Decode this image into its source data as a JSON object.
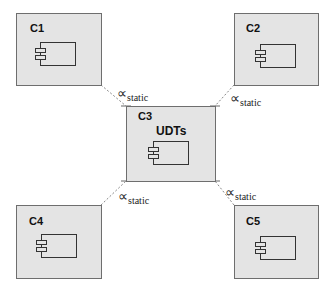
{
  "diagram": {
    "type": "component-diagram",
    "nodes": [
      {
        "id": "C1",
        "label": "C1",
        "sublabel": ""
      },
      {
        "id": "C2",
        "label": "C2",
        "sublabel": ""
      },
      {
        "id": "C3",
        "label": "C3",
        "sublabel": "UDTs"
      },
      {
        "id": "C4",
        "label": "C4",
        "sublabel": ""
      },
      {
        "id": "C5",
        "label": "C5",
        "sublabel": ""
      }
    ],
    "connectors": [
      {
        "from": "C1",
        "to": "C3",
        "symbol": "∝",
        "subscript": "static",
        "style": "dashed"
      },
      {
        "from": "C2",
        "to": "C3",
        "symbol": "∝",
        "subscript": "static",
        "style": "dashed"
      },
      {
        "from": "C4",
        "to": "C3",
        "symbol": "∝",
        "subscript": "static",
        "style": "dashed"
      },
      {
        "from": "C5",
        "to": "C3",
        "symbol": "∝",
        "subscript": "static",
        "style": "dashed"
      }
    ],
    "colors": {
      "node_fill": "#e4e4e4",
      "node_border": "#6e6e6e",
      "connector": "#888888"
    }
  }
}
